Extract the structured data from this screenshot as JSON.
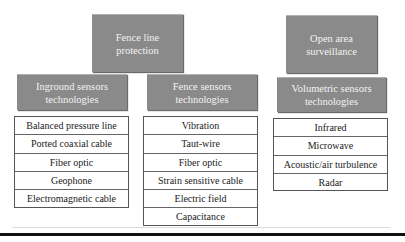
{
  "categories": {
    "fence_line": {
      "label": "Fence line protection"
    },
    "open_area": {
      "label": "Open area surveillance"
    }
  },
  "groups": [
    {
      "title": "Inground sensors technologies",
      "items": [
        "Balanced pressure line",
        "Ported coaxial cable",
        "Fiber optic",
        "Geophone",
        "Electromagnetic cable"
      ]
    },
    {
      "title": "Fence sensors technologies",
      "items": [
        "Vibration",
        "Taut-wire",
        "Fiber optic",
        "Strain sensitive cable",
        "Electric field",
        "Capacitance"
      ]
    },
    {
      "title": "Volumetric sensors technologies",
      "items": [
        "Infrared",
        "Microwave",
        "Acoustic/air turbulence",
        "Radar"
      ]
    }
  ],
  "colors": {
    "header_fill": "#8a8a8a",
    "header_text": "#f2f2f2",
    "table_border": "#555555"
  }
}
